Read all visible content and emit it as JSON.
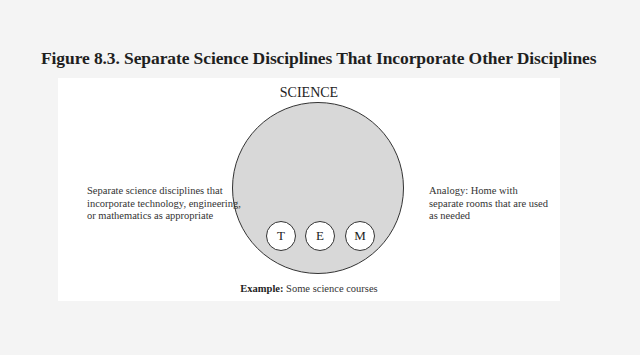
{
  "figure": {
    "title": "Figure 8.3. Separate Science Disciplines That Incorporate Other Disciplines"
  },
  "diagram": {
    "main_label": "SCIENCE",
    "sub_disciplines": [
      "T",
      "E",
      "M"
    ],
    "left_description": "Separate science disciplines that incorporate technology, engineering, or mathematics as appropriate",
    "right_analogy": "Analogy: Home with separate rooms that are used as needed",
    "example_label": "Example:",
    "example_text": " Some science courses",
    "colors": {
      "page_background": "#f4f4f4",
      "panel_background": "#ffffff",
      "science_circle_fill": "#d8d8d8",
      "sub_circle_fill": "#ffffff",
      "outline": "#333333"
    }
  }
}
